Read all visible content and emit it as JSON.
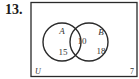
{
  "problem": {
    "number": "13."
  },
  "diagram": {
    "type": "venn",
    "universe_label": "U",
    "sets": [
      {
        "label": "A",
        "only_count": "15"
      },
      {
        "label": "B",
        "only_count": "18"
      }
    ],
    "intersection_count": "10",
    "outside_count": "7",
    "colors": {
      "stroke": "#2a2a2a",
      "background": "#ffffff",
      "text": "#333333"
    }
  }
}
